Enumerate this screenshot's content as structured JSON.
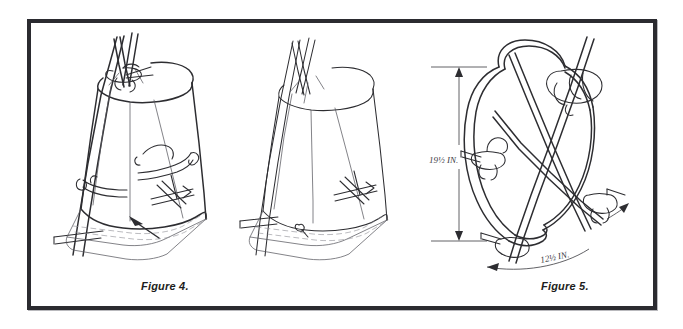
{
  "plate": {
    "background_color": "#ffffff",
    "frame_color": "#2b2b30",
    "ink_color": "#2d2d31"
  },
  "figures": [
    {
      "id": "figure-4",
      "caption": "Figure 4.",
      "subject": "tarp-covered tripod shelter with lashings",
      "annotations": []
    },
    {
      "id": "figure-5",
      "caption": "Figure 5.",
      "subject": "tarp-covered tripod shelter plain view",
      "annotations": []
    },
    {
      "id": "figure-6",
      "caption": "Figure 6.",
      "subject": "bare tripod frame with rope hoop and dimensions",
      "annotations": [
        {
          "name": "height-dimension",
          "value": "19½ IN.",
          "orientation": "vertical"
        },
        {
          "name": "base-dimension",
          "value": "12½ IN.",
          "orientation": "diagonal"
        }
      ]
    }
  ]
}
